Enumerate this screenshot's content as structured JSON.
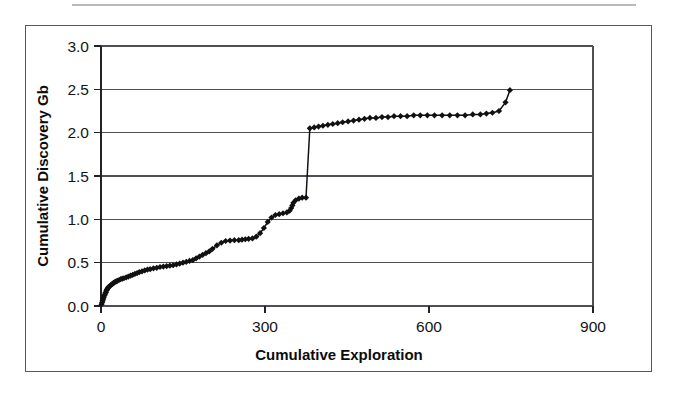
{
  "figure": {
    "frame_border_color": "#55585c",
    "background_color": "#ffffff",
    "ink_color": "#111111"
  },
  "chart_data": {
    "type": "line",
    "title": "",
    "subtitle": "",
    "xlabel": "Cumulative Exploration",
    "ylabel": "Cumulative Discovery Gb",
    "xlim": [
      0,
      900
    ],
    "ylim": [
      0.0,
      3.0
    ],
    "xticks": [
      0,
      300,
      600,
      900
    ],
    "xtick_labels": [
      "0",
      "300",
      "600",
      "900"
    ],
    "yticks": [
      0.0,
      0.5,
      1.0,
      1.5,
      2.0,
      2.5,
      3.0
    ],
    "ytick_labels": [
      "0.0",
      "0.5",
      "1.0",
      "1.5",
      "2.0",
      "2.5",
      "3.0"
    ],
    "grid": "horizontal",
    "legend": "none",
    "marker": "diamond",
    "marker_color": "#111111",
    "line_color": "#111111",
    "series": [
      {
        "name": "Cumulative discovery",
        "x": [
          1,
          2,
          3,
          4,
          5,
          6,
          7,
          8,
          9,
          10,
          11,
          12,
          13,
          14,
          16,
          18,
          20,
          22,
          24,
          26,
          28,
          30,
          33,
          36,
          39,
          42,
          46,
          50,
          54,
          58,
          62,
          66,
          70,
          75,
          80,
          85,
          90,
          96,
          102,
          108,
          114,
          120,
          126,
          132,
          138,
          144,
          150,
          156,
          162,
          168,
          174,
          180,
          186,
          192,
          198,
          204,
          212,
          220,
          228,
          236,
          244,
          252,
          258,
          264,
          270,
          277,
          284,
          291,
          298,
          305,
          312,
          319,
          326,
          333,
          340,
          345,
          348,
          350,
          352,
          356,
          362,
          368,
          375,
          382,
          390,
          398,
          406,
          415,
          424,
          433,
          442,
          452,
          462,
          472,
          482,
          492,
          503,
          514,
          525,
          536,
          548,
          560,
          572,
          584,
          597,
          610,
          624,
          638,
          652,
          666,
          680,
          694,
          705,
          716,
          728,
          740,
          748
        ],
        "y": [
          0.02,
          0.04,
          0.06,
          0.08,
          0.1,
          0.12,
          0.13,
          0.15,
          0.16,
          0.18,
          0.19,
          0.2,
          0.21,
          0.22,
          0.23,
          0.24,
          0.25,
          0.26,
          0.27,
          0.28,
          0.285,
          0.29,
          0.3,
          0.31,
          0.315,
          0.32,
          0.33,
          0.34,
          0.35,
          0.36,
          0.37,
          0.38,
          0.39,
          0.4,
          0.41,
          0.42,
          0.425,
          0.435,
          0.44,
          0.45,
          0.455,
          0.46,
          0.465,
          0.47,
          0.48,
          0.49,
          0.5,
          0.51,
          0.52,
          0.53,
          0.55,
          0.57,
          0.59,
          0.61,
          0.63,
          0.66,
          0.7,
          0.73,
          0.75,
          0.755,
          0.76,
          0.76,
          0.765,
          0.77,
          0.775,
          0.78,
          0.8,
          0.84,
          0.9,
          0.97,
          1.02,
          1.05,
          1.06,
          1.07,
          1.08,
          1.1,
          1.13,
          1.16,
          1.19,
          1.22,
          1.24,
          1.25,
          1.25,
          2.05,
          2.06,
          2.07,
          2.08,
          2.09,
          2.1,
          2.11,
          2.12,
          2.13,
          2.14,
          2.15,
          2.16,
          2.17,
          2.17,
          2.18,
          2.18,
          2.19,
          2.19,
          2.19,
          2.2,
          2.2,
          2.2,
          2.2,
          2.2,
          2.2,
          2.2,
          2.2,
          2.21,
          2.21,
          2.22,
          2.23,
          2.25,
          2.35,
          2.49
        ]
      }
    ],
    "annotations": [
      {
        "label": "step-change at cumulative exploration ~382",
        "from_value": 1.25,
        "to_value": 2.05
      }
    ]
  },
  "axes": {
    "x_axis_name": "Cumulative Exploration",
    "y_axis_name": "Cumulative Discovery Gb"
  }
}
